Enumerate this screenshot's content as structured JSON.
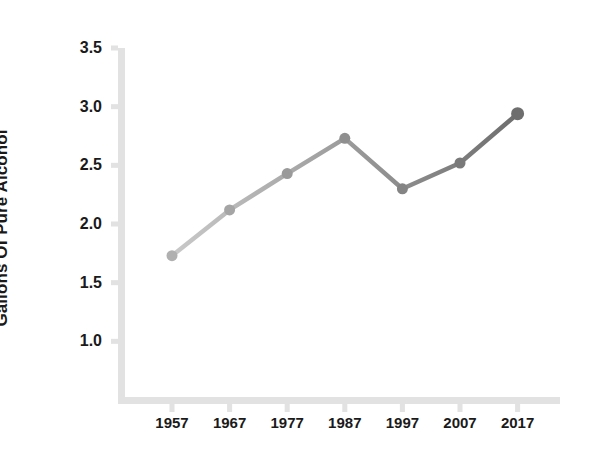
{
  "chart_data": {
    "type": "line",
    "title": "",
    "xlabel": "",
    "ylabel": "Gallons Of Pure Alcohol",
    "categories": [
      "1957",
      "1967",
      "1977",
      "1987",
      "1997",
      "2007",
      "2017"
    ],
    "x": [
      1957,
      1967,
      1977,
      1987,
      1997,
      2007,
      2017
    ],
    "values": [
      1.73,
      2.12,
      2.43,
      2.73,
      2.3,
      2.52,
      2.94
    ],
    "series": [
      {
        "name": "Gallons Of Pure Alcohol",
        "values": [
          1.73,
          2.12,
          2.43,
          2.73,
          2.3,
          2.52,
          2.94
        ]
      }
    ],
    "ylim": [
      0.5,
      3.5
    ],
    "xlim": [
      1952,
      2022
    ],
    "ytick_labels": [
      "3.5",
      "3.0",
      "2.5",
      "2.0",
      "1.5",
      "1.0"
    ],
    "ytick_values": [
      3.5,
      3.0,
      2.5,
      2.0,
      1.5,
      1.0
    ],
    "xtick_labels": [
      "1957",
      "1967",
      "1977",
      "1987",
      "1997",
      "2007",
      "2017"
    ],
    "grid": false,
    "legend": false,
    "legend_position": "none",
    "marker": "circle",
    "line_color_start": "#c9c9c9",
    "line_color_end": "#6e6e6e",
    "marker_color": "#b0b0b0",
    "axis_color": "#e2e2e2",
    "text_color": "#1a1a1a",
    "background": "#ffffff"
  },
  "axes": {
    "y_title": "Gallons Of Pure Alcohol"
  }
}
